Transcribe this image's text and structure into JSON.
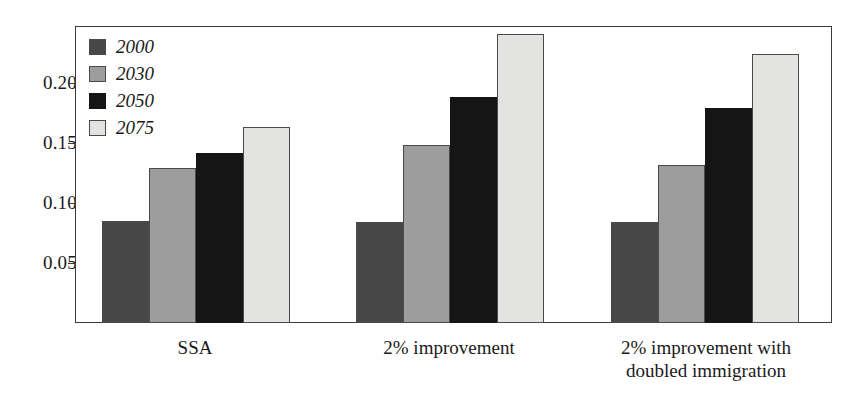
{
  "chart_data": {
    "type": "bar",
    "title": "",
    "subtitle": "",
    "xlabel": "",
    "ylabel": "",
    "categories": [
      "SSA",
      "2% improvement",
      "2% improvement with\ndoubled immigration"
    ],
    "series": [
      {
        "name": "2000",
        "color": "#474747",
        "values": [
          0.085,
          0.084,
          0.084
        ]
      },
      {
        "name": "2030",
        "color": "#9d9d9d",
        "values": [
          0.129,
          0.148,
          0.132
        ]
      },
      {
        "name": "2050",
        "color": "#151515",
        "values": [
          0.142,
          0.188,
          0.179
        ]
      },
      {
        "name": "2075",
        "color": "#e3e3e1",
        "values": [
          0.163,
          0.241,
          0.224
        ]
      }
    ],
    "ylim": [
      0.0,
      0.2475
    ],
    "yticks": [
      0.05,
      0.1,
      0.15,
      0.2
    ],
    "ytick_labels": [
      "0.05",
      "0.10",
      "0.15",
      "0.20"
    ],
    "grid": false,
    "legend_position": "top-left"
  },
  "axis": {
    "ticks": [
      {
        "label": "0.20",
        "value": 0.2
      },
      {
        "label": "0.15",
        "value": 0.15
      },
      {
        "label": "0.10",
        "value": 0.1
      },
      {
        "label": "0.05",
        "value": 0.05
      }
    ]
  },
  "legend": {
    "entries": [
      {
        "label": "2000",
        "swatch": "legend-swatch-2000"
      },
      {
        "label": "2030",
        "swatch": "legend-swatch-2030"
      },
      {
        "label": "2050",
        "swatch": "legend-swatch-2050"
      },
      {
        "label": "2075",
        "swatch": "legend-swatch-2075"
      }
    ]
  },
  "categories": [
    {
      "line1": "SSA",
      "line2": ""
    },
    {
      "line1": "2% improvement",
      "line2": ""
    },
    {
      "line1": "2% improvement with",
      "line2": "doubled immigration"
    }
  ]
}
